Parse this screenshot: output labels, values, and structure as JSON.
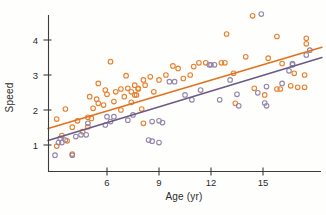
{
  "figure": {
    "background": "#FEFEFC",
    "axis_color": "#3C3C3C",
    "text_color": "#2B2B2B"
  },
  "chart_data": {
    "type": "scatter",
    "title": "",
    "xlabel": "Age (yr)",
    "ylabel": "Speed",
    "xlim": [
      2.4,
      18.6
    ],
    "ylim": [
      0.2,
      4.95
    ],
    "xticks": [
      6,
      9,
      12,
      15
    ],
    "yticks": [
      1,
      2,
      3,
      4
    ],
    "grid": false,
    "legend": "none",
    "marker": "open-circle",
    "series": [
      {
        "name": "series-orange",
        "color": "#E8802F",
        "points": [
          [
            3.1,
            1.74
          ],
          [
            3.6,
            2.03
          ],
          [
            3.4,
            1.27
          ],
          [
            3.1,
            0.97
          ],
          [
            3.7,
            1.12
          ],
          [
            4.0,
            0.74
          ],
          [
            4.0,
            1.51
          ],
          [
            4.3,
            1.69
          ],
          [
            4.6,
            1.38
          ],
          [
            4.9,
            1.79
          ],
          [
            5.1,
            1.76
          ],
          [
            4.9,
            1.52
          ],
          [
            5.0,
            2.38
          ],
          [
            5.2,
            2.05
          ],
          [
            5.4,
            2.31
          ],
          [
            5.5,
            2.19
          ],
          [
            5.5,
            2.76
          ],
          [
            5.9,
            2.57
          ],
          [
            5.8,
            2.14
          ],
          [
            6.0,
            2.45
          ],
          [
            6.2,
            3.38
          ],
          [
            6.4,
            2.24
          ],
          [
            6.5,
            2.52
          ],
          [
            6.8,
            2.6
          ],
          [
            6.8,
            2.0
          ],
          [
            7.0,
            2.38
          ],
          [
            7.1,
            2.98
          ],
          [
            7.2,
            2.62
          ],
          [
            7.4,
            2.22
          ],
          [
            7.4,
            2.52
          ],
          [
            7.6,
            2.43
          ],
          [
            7.6,
            2.71
          ],
          [
            7.7,
            2.43
          ],
          [
            7.8,
            2.62
          ],
          [
            7.8,
            2.6
          ],
          [
            8.0,
            2.03
          ],
          [
            8.1,
            1.62
          ],
          [
            8.1,
            2.86
          ],
          [
            8.2,
            2.71
          ],
          [
            8.5,
            2.95
          ],
          [
            8.7,
            2.52
          ],
          [
            9.0,
            2.86
          ],
          [
            9.4,
            3.0
          ],
          [
            9.8,
            3.26
          ],
          [
            10.1,
            3.19
          ],
          [
            10.4,
            2.9
          ],
          [
            10.8,
            3.0
          ],
          [
            11.0,
            3.24
          ],
          [
            11.3,
            3.35
          ],
          [
            11.7,
            3.35
          ],
          [
            12.6,
            3.35
          ],
          [
            12.8,
            3.35
          ],
          [
            12.9,
            4.17
          ],
          [
            13.3,
            3.05
          ],
          [
            13.4,
            2.19
          ],
          [
            14.0,
            3.52
          ],
          [
            14.4,
            4.69
          ],
          [
            14.5,
            2.62
          ],
          [
            15.1,
            2.43
          ],
          [
            15.3,
            3.48
          ],
          [
            15.8,
            4.1
          ],
          [
            15.8,
            2.6
          ],
          [
            16.0,
            2.6
          ],
          [
            16.1,
            3.33
          ],
          [
            16.6,
            2.69
          ],
          [
            16.8,
            3.05
          ],
          [
            17.0,
            2.65
          ],
          [
            17.4,
            2.65
          ],
          [
            17.4,
            3.0
          ],
          [
            17.5,
            4.05
          ],
          [
            17.5,
            3.89
          ]
        ]
      },
      {
        "name": "series-purple",
        "color": "#9486AA",
        "points": [
          [
            3.0,
            0.71
          ],
          [
            3.2,
            1.07
          ],
          [
            3.3,
            1.19
          ],
          [
            3.4,
            1.07
          ],
          [
            3.6,
            1.14
          ],
          [
            4.0,
            0.71
          ],
          [
            4.2,
            1.24
          ],
          [
            4.5,
            1.29
          ],
          [
            4.8,
            1.29
          ],
          [
            4.9,
            1.62
          ],
          [
            5.9,
            1.57
          ],
          [
            6.0,
            1.81
          ],
          [
            6.2,
            1.67
          ],
          [
            6.4,
            1.81
          ],
          [
            7.2,
            1.71
          ],
          [
            7.5,
            1.86
          ],
          [
            8.4,
            1.14
          ],
          [
            8.6,
            1.11
          ],
          [
            8.6,
            1.67
          ],
          [
            9.0,
            1.07
          ],
          [
            9.0,
            1.69
          ],
          [
            9.2,
            1.64
          ],
          [
            9.6,
            2.81
          ],
          [
            9.9,
            2.81
          ],
          [
            10.5,
            2.43
          ],
          [
            10.9,
            2.29
          ],
          [
            11.4,
            2.57
          ],
          [
            11.9,
            3.29
          ],
          [
            12.0,
            3.29
          ],
          [
            12.2,
            3.29
          ],
          [
            12.5,
            2.29
          ],
          [
            13.1,
            2.86
          ],
          [
            13.5,
            2.45
          ],
          [
            13.6,
            2.12
          ],
          [
            14.7,
            2.49
          ],
          [
            14.9,
            4.74
          ],
          [
            15.1,
            2.2
          ],
          [
            15.2,
            2.67
          ],
          [
            15.2,
            2.12
          ],
          [
            16.1,
            2.76
          ],
          [
            16.5,
            3.12
          ],
          [
            16.7,
            3.29
          ],
          [
            16.7,
            3.33
          ],
          [
            17.5,
            3.57
          ],
          [
            17.7,
            3.71
          ]
        ]
      }
    ],
    "trend_lines": [
      {
        "series": "series-orange",
        "color": "#E2711D",
        "x1": 2.6,
        "y1": 1.47,
        "x2": 18.4,
        "y2": 3.79
      },
      {
        "series": "series-purple",
        "color": "#6A5A85",
        "x1": 2.6,
        "y1": 1.13,
        "x2": 18.4,
        "y2": 3.5
      }
    ]
  }
}
